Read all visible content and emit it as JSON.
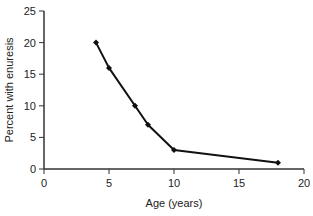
{
  "chart_data": {
    "type": "line",
    "title": "",
    "xlabel": "Age (years)",
    "ylabel": "Percent with enuresis",
    "xlim": [
      0,
      20
    ],
    "ylim": [
      0,
      25
    ],
    "xticks": [
      0,
      5,
      10,
      15,
      20
    ],
    "yticks": [
      0,
      5,
      10,
      15,
      20,
      25
    ],
    "grid": false,
    "legend": null,
    "series": [
      {
        "name": "Percent with enuresis",
        "x": [
          4,
          5,
          7,
          8,
          10,
          18
        ],
        "y": [
          20,
          16,
          10,
          7,
          3,
          1
        ],
        "color": "#111111",
        "marker": "diamond"
      }
    ]
  }
}
